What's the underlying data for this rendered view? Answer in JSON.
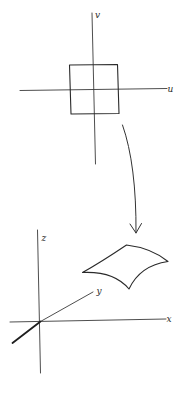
{
  "figure": {
    "stroke_color": "#2a2a2a",
    "background": "#ffffff"
  },
  "uv_plane": {
    "u_label": "u",
    "v_label": "v",
    "u_axis": {
      "x1": 20,
      "y1": 90.5,
      "x2": 167,
      "y2": 88.5
    },
    "v_axis": {
      "x1": 92,
      "y1": 13,
      "x2": 95.5,
      "y2": 164
    },
    "square": {
      "top_left": [
        69.5,
        65
      ],
      "top_right": [
        117.5,
        64.5
      ],
      "bottom_right": [
        119,
        113.5
      ],
      "bottom_left": [
        71,
        114
      ]
    }
  },
  "mapping_arrow": {
    "start": [
      122.5,
      125
    ],
    "end": [
      136,
      233
    ],
    "head_left": [
      130,
      224
    ],
    "head_right": [
      141.5,
      223.5
    ]
  },
  "xyz_space": {
    "x_label": "x",
    "y_label": "y",
    "z_label": "z",
    "origin": [
      40.5,
      321.5
    ],
    "x_axis": {
      "x1": 10,
      "y1": 322,
      "x2": 166,
      "y2": 319
    },
    "z_axis": {
      "x1": 37.5,
      "y1": 230,
      "x2": 40.5,
      "y2": 373
    },
    "y_axis": {
      "x1": 40.5,
      "y1": 321.5,
      "x2": 93,
      "y2": 292
    },
    "y_axis_negative": {
      "x1": 40.5,
      "y1": 321.5,
      "x2": 12.5,
      "y2": 343
    },
    "surface_patch": {
      "left": [
        82.5,
        272.5
      ],
      "top": [
        126.5,
        245
      ],
      "right": [
        168,
        261.5
      ],
      "bottom": [
        129,
        289
      ]
    }
  }
}
